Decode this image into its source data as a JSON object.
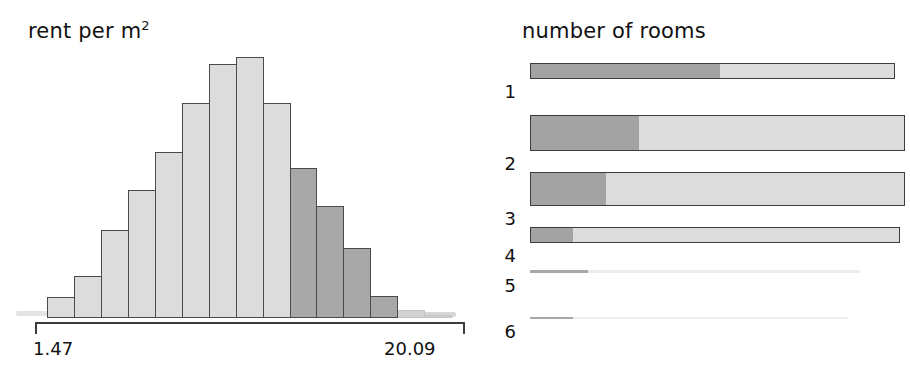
{
  "chart_data": [
    {
      "type": "bar",
      "title": "rent per m2",
      "title_base": "rent per m",
      "title_sup": "2",
      "xlabel": "rent per m2",
      "ylabel": "",
      "axis_min_label": "1.47",
      "axis_max_label": "20.09",
      "xlim": [
        1.47,
        20.09
      ],
      "grid": false,
      "legend": "none",
      "orientation": "vertical",
      "note": "histogram of rent per square metre; lighter bars on the left of the distribution, darker bars forming the right tail",
      "bin_count": 15,
      "categories": [
        "1.47-2.71",
        "2.71-3.95",
        "3.95-5.19",
        "5.19-6.43",
        "6.43-7.67",
        "7.67-8.91",
        "8.91-10.15",
        "10.15-11.39",
        "11.39-12.63",
        "12.63-13.87",
        "13.87-15.11",
        "15.11-16.35",
        "16.35-17.59",
        "17.59-18.83",
        "18.83-20.09"
      ],
      "values": [
        21,
        42,
        88,
        128,
        166,
        215,
        254,
        261,
        215,
        150,
        112,
        70,
        22,
        8,
        3
      ],
      "bar_shades": [
        "light",
        "light",
        "light",
        "light",
        "light",
        "light",
        "light",
        "light",
        "light",
        "dark",
        "dark",
        "dark",
        "dark",
        "faint",
        "faint"
      ]
    },
    {
      "type": "bar",
      "title": "number of rooms",
      "orientation": "horizontal-stacked",
      "grid": false,
      "legend": "none",
      "note": "each row is a spine/mosaic bar; row thickness encodes the share of flats with that room count, the dark left segment encodes the sub-share",
      "categories": [
        "1",
        "2",
        "3",
        "4",
        "5",
        "6"
      ],
      "rows": [
        {
          "label": "1",
          "thickness": 16,
          "dark_fraction": 0.52
        },
        {
          "label": "2",
          "thickness": 36,
          "dark_fraction": 0.29
        },
        {
          "label": "3",
          "thickness": 34,
          "dark_fraction": 0.2
        },
        {
          "label": "4",
          "thickness": 16,
          "dark_fraction": 0.115
        },
        {
          "label": "5",
          "thickness": 3,
          "dark_fraction": 0.175
        },
        {
          "label": "6",
          "thickness": 2,
          "dark_fraction": 0.135
        }
      ]
    }
  ],
  "hist": {
    "title_base": "rent per m",
    "title_sup": "2",
    "axis_min": "1.47",
    "axis_max": "20.09"
  },
  "rooms": {
    "title": "number of rooms"
  },
  "colors": {
    "light_gray": "#dcdcdc",
    "dark_gray": "#a8a8a8",
    "outline": "#4a4a4a",
    "axis": "#3b3b3b",
    "text": "#111111",
    "background": "#ffffff"
  }
}
